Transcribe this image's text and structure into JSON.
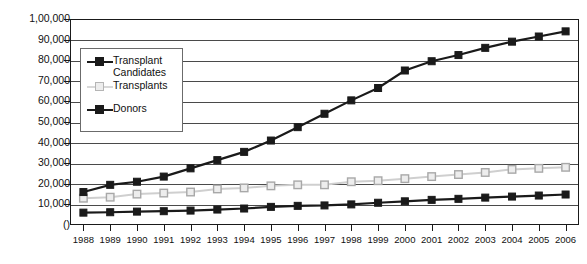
{
  "chart_data": {
    "type": "line",
    "title": "",
    "xlabel": "",
    "ylabel": "",
    "x": [
      1988,
      1989,
      1990,
      1991,
      1992,
      1993,
      1994,
      1995,
      1996,
      1997,
      1998,
      1999,
      2000,
      2001,
      2002,
      2003,
      2004,
      2005,
      2006
    ],
    "categories": [
      "1988",
      "1989",
      "1990",
      "1991",
      "1992",
      "1993",
      "1994",
      "1995",
      "1996",
      "1997",
      "1998",
      "1999",
      "2000",
      "2001",
      "2002",
      "2003",
      "2004",
      "2005",
      "2006"
    ],
    "ylim": [
      0,
      100000
    ],
    "ytick_values": [
      0,
      10000,
      20000,
      30000,
      40000,
      50000,
      60000,
      70000,
      80000,
      90000,
      100000
    ],
    "ytick_labels": [
      "()",
      "10,000",
      "20,000",
      "30,000",
      "40,000",
      "50,000",
      "60,000",
      "70,000",
      "80,000",
      "90,000",
      "1,00,000"
    ],
    "grid": true,
    "legend_position": "upper-left-inside",
    "series": [
      {
        "name": "Transplant Candidates",
        "legend_label_line1": "Transplant",
        "legend_label_line2": "Candidates",
        "marker": "filled-square",
        "color": "#1a1a1a",
        "values": [
          16000,
          19500,
          21000,
          23500,
          27500,
          31500,
          35500,
          41000,
          47500,
          54000,
          60500,
          66500,
          75000,
          79500,
          82500,
          86000,
          89000,
          91500,
          94000
        ]
      },
      {
        "name": "Transplants",
        "legend_label_line1": "Transplants",
        "legend_label_line2": "",
        "marker": "open-square",
        "color": "#cfcfcf",
        "values": [
          13000,
          13500,
          15000,
          15500,
          16000,
          17500,
          18000,
          19000,
          19500,
          19500,
          21000,
          21500,
          22500,
          23500,
          24500,
          25500,
          27000,
          27500,
          28000
        ]
      },
      {
        "name": "Donors",
        "legend_label_line1": "Donors",
        "legend_label_line2": "",
        "marker": "filled-square",
        "color": "#1a1a1a",
        "values": [
          6000,
          6200,
          6500,
          6700,
          7000,
          7500,
          8000,
          8800,
          9300,
          9500,
          10000,
          10800,
          11500,
          12200,
          12700,
          13300,
          13800,
          14300,
          14800
        ]
      }
    ]
  },
  "legend": {
    "entries": [
      {
        "label_1": "Transplant",
        "label_2": "Candidates",
        "marker": "filled-square-dark"
      },
      {
        "label_1": "Transplants",
        "label_2": "",
        "marker": "open-square-light"
      },
      {
        "label_1": "Donors",
        "label_2": "",
        "marker": "filled-square-dark"
      }
    ]
  },
  "colors": {
    "axis": "#1a1a1a",
    "grid": "#4a4a4a",
    "series_dark": "#1a1a1a",
    "series_light": "#cfcfcf",
    "background": "#ffffff"
  }
}
